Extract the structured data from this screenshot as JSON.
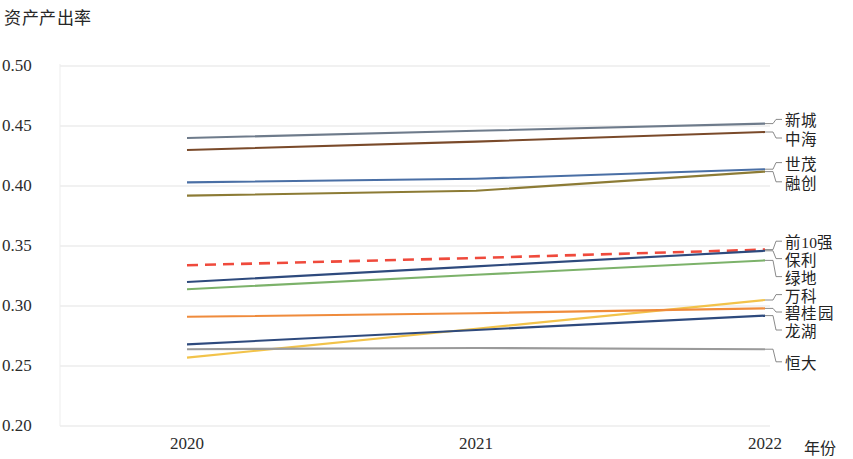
{
  "chart_data": {
    "type": "line",
    "title": "资产产出率",
    "ylabel": "资产产出率",
    "xlabel": "年份",
    "x": [
      "2020",
      "2021",
      "2022"
    ],
    "categories": [
      "2020",
      "2021",
      "2022"
    ],
    "ylim": [
      0.2,
      0.5
    ],
    "yticks": [
      "0.20",
      "0.25",
      "0.30",
      "0.35",
      "0.40",
      "0.45",
      "0.50"
    ],
    "ytick_values": [
      0.2,
      0.25,
      0.3,
      0.35,
      0.4,
      0.45,
      0.5
    ],
    "grid": true,
    "legend_position": "right-inline-labels",
    "series": [
      {
        "name": "新城",
        "values": [
          0.44,
          0.446,
          0.452
        ],
        "color": "#6e7b8b",
        "style": "solid"
      },
      {
        "name": "中海",
        "values": [
          0.43,
          0.437,
          0.445
        ],
        "color": "#7a4a2a",
        "style": "solid"
      },
      {
        "name": "世茂",
        "values": [
          0.403,
          0.406,
          0.414
        ],
        "color": "#4a6fa5",
        "style": "solid"
      },
      {
        "name": "融创",
        "values": [
          0.392,
          0.396,
          0.412
        ],
        "color": "#8c7b35",
        "style": "solid"
      },
      {
        "name": "前10强",
        "values": [
          0.334,
          0.34,
          0.347
        ],
        "color": "#ef4a3c",
        "style": "dashed"
      },
      {
        "name": "保利",
        "values": [
          0.32,
          0.333,
          0.346
        ],
        "color": "#2e4a7d",
        "style": "solid"
      },
      {
        "name": "绿地",
        "values": [
          0.314,
          0.326,
          0.338
        ],
        "color": "#7cb26a",
        "style": "solid"
      },
      {
        "name": "万科",
        "values": [
          0.257,
          0.281,
          0.305
        ],
        "color": "#f2c34a",
        "style": "solid"
      },
      {
        "name": "碧桂园",
        "values": [
          0.291,
          0.294,
          0.298
        ],
        "color": "#ef8b3c",
        "style": "solid"
      },
      {
        "name": "龙湖",
        "values": [
          0.268,
          0.28,
          0.292
        ],
        "color": "#2e4a7d",
        "style": "solid"
      },
      {
        "name": "恒大",
        "values": [
          0.264,
          0.265,
          0.264
        ],
        "color": "#9a9a9a",
        "style": "solid"
      }
    ],
    "label_anchors": [
      {
        "name": "新城",
        "y": 0.4555
      },
      {
        "name": "中海",
        "y": 0.44
      },
      {
        "name": "世茂",
        "y": 0.4195
      },
      {
        "name": "融创",
        "y": 0.4035
      },
      {
        "name": "前10强",
        "y": 0.354
      },
      {
        "name": "保利",
        "y": 0.3395
      },
      {
        "name": "绿地",
        "y": 0.3245
      },
      {
        "name": "万科",
        "y": 0.3095
      },
      {
        "name": "碧桂园",
        "y": 0.295
      },
      {
        "name": "龙湖",
        "y": 0.28
      },
      {
        "name": "恒大",
        "y": 0.2535
      }
    ]
  },
  "axis": {
    "y_title": "资产产出率",
    "x_title": "年份"
  }
}
